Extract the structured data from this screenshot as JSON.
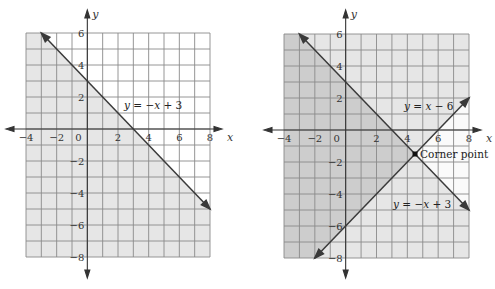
{
  "chart_data": [
    {
      "type": "line",
      "title": "",
      "xlabel": "x",
      "ylabel": "y",
      "xlim": [
        -4,
        8
      ],
      "ylim": [
        -8,
        6
      ],
      "grid": true,
      "x_ticks": [
        "-4",
        "-2",
        "0",
        "2",
        "4",
        "6",
        "8"
      ],
      "y_ticks": [
        "6",
        "4",
        "2",
        "-2",
        "-4",
        "-6",
        "-8"
      ],
      "series": [
        {
          "name": "y = −x + 3",
          "x": [
            -3,
            8
          ],
          "y": [
            6,
            -5
          ]
        }
      ],
      "shaded_regions": [
        {
          "inequality": "y ≤ −x + 3",
          "shade": "light"
        }
      ],
      "annotations": [
        {
          "text": "y = −x + 3",
          "x": 2.3,
          "y": 1.3
        }
      ]
    },
    {
      "type": "line",
      "title": "",
      "xlabel": "x",
      "ylabel": "y",
      "xlim": [
        -4,
        8
      ],
      "ylim": [
        -8,
        6
      ],
      "grid": true,
      "x_ticks": [
        "-4",
        "-2",
        "0",
        "2",
        "4",
        "6",
        "8"
      ],
      "y_ticks": [
        "6",
        "4",
        "2",
        "-2",
        "-4",
        "-6",
        "-8"
      ],
      "series": [
        {
          "name": "y = −x + 3",
          "x": [
            -3,
            8
          ],
          "y": [
            6,
            -5
          ]
        },
        {
          "name": "y = x − 6",
          "x": [
            -2,
            8
          ],
          "y": [
            -8,
            2
          ]
        }
      ],
      "shaded_regions": [
        {
          "inequality": "y ≤ −x + 3 and y ≥ x − 6",
          "shade": "dark"
        },
        {
          "inequality": "exactly one of y ≤ −x + 3 / y ≥ x − 6 false on one side",
          "shade": "light"
        }
      ],
      "points": [
        {
          "label": "Corner point",
          "x": 4.5,
          "y": -1.5
        }
      ],
      "annotations": [
        {
          "text": "y = x − 6",
          "x": 3.8,
          "y": 1.1
        },
        {
          "text": "y = −x + 3",
          "x": 3.2,
          "y": -3.9
        },
        {
          "text": "Corner point",
          "x": 4.9,
          "y": -1.5
        }
      ]
    }
  ],
  "labels": {
    "x_axis": "x",
    "y_axis": "y",
    "left_eq": [
      "y",
      " = −",
      "x",
      " + 3"
    ],
    "right_eq1": [
      "y",
      " = ",
      "x",
      " − 6"
    ],
    "right_eq2": [
      "y",
      " = −",
      "x",
      " + 3"
    ],
    "corner": "Corner point",
    "ticks_x": [
      "−4",
      "−2",
      "0",
      "2",
      "4",
      "6",
      "8"
    ],
    "ticks_y_pos": [
      "6",
      "4",
      "2"
    ],
    "ticks_y_neg": [
      "−2",
      "−4",
      "−6",
      "−8"
    ]
  },
  "colors": {
    "light_shade": "#e6e6e6",
    "dark_shade": "#cdcdcd",
    "grid": "#8a8a8a",
    "axis": "#333333",
    "line": "#3a3a3a"
  }
}
